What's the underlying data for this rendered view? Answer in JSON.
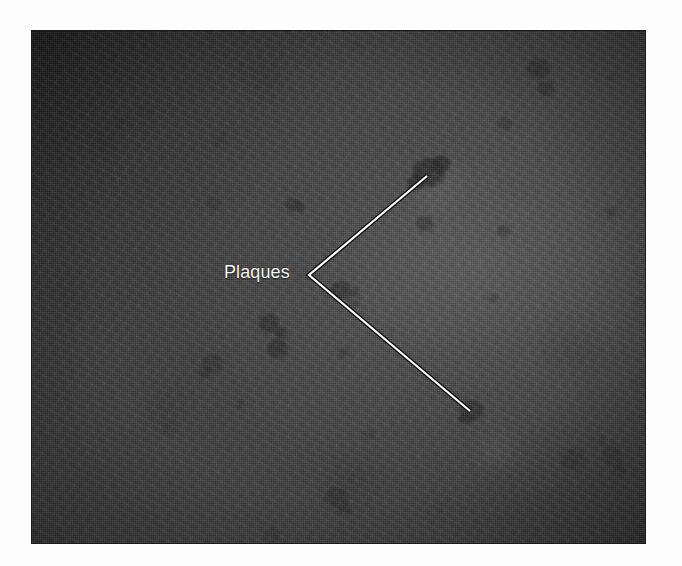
{
  "figure": {
    "kind": "micrograph",
    "alt_description": "Grayscale plaque assay micrograph showing dark circular plaques on a gray cell monolayer",
    "canvas": {
      "width": 682,
      "height": 566
    },
    "page_background": "#fdfdfd"
  },
  "micrograph": {
    "frame": {
      "x": 31,
      "y": 30,
      "width": 615,
      "height": 514
    },
    "base_color": "#3c3c3c",
    "border_color": "#1a1a1a",
    "illumination": {
      "bright_center": "#6e6e6e",
      "dark_corner": "#242424"
    }
  },
  "annotation": {
    "label": {
      "text": "Plaques",
      "color": "#f4f4f4",
      "x": 224,
      "y": 263,
      "font_size_px": 18
    },
    "leader": {
      "color": "#ffffff",
      "outline_color": "#111111",
      "stroke_width": 2.2,
      "vertex": {
        "x": 309,
        "y": 275
      },
      "tips": [
        {
          "x": 427,
          "y": 176,
          "target": "upper-plaque-cluster"
        },
        {
          "x": 470,
          "y": 411,
          "target": "lower-plaque"
        }
      ]
    }
  },
  "plaques": [
    {
      "cx": 131,
      "cy": 115,
      "rx": 13,
      "ry": 11,
      "shade": "#2a2a2a",
      "opacity": 0.74
    },
    {
      "cx": 120,
      "cy": 122,
      "rx": 8,
      "ry": 7,
      "shade": "#242424",
      "opacity": 0.7
    },
    {
      "cx": 145,
      "cy": 110,
      "rx": 7,
      "ry": 6,
      "shade": "#262626",
      "opacity": 0.6
    },
    {
      "cx": 218,
      "cy": 139,
      "rx": 8,
      "ry": 7,
      "shade": "#2c2c2c",
      "opacity": 0.62
    },
    {
      "cx": 50,
      "cy": 178,
      "rx": 10,
      "ry": 8,
      "shade": "#2a2a2a",
      "opacity": 0.66
    },
    {
      "cx": 213,
      "cy": 203,
      "rx": 7,
      "ry": 7,
      "shade": "#2c2c2c",
      "opacity": 0.58
    },
    {
      "cx": 292,
      "cy": 204,
      "rx": 8,
      "ry": 7,
      "shade": "#2a2a2a",
      "opacity": 0.62
    },
    {
      "cx": 299,
      "cy": 206,
      "rx": 5,
      "ry": 5,
      "shade": "#232323",
      "opacity": 0.6
    },
    {
      "cx": 538,
      "cy": 68,
      "rx": 12,
      "ry": 10,
      "shade": "#282828",
      "opacity": 0.72
    },
    {
      "cx": 545,
      "cy": 88,
      "rx": 9,
      "ry": 8,
      "shade": "#2a2a2a",
      "opacity": 0.66
    },
    {
      "cx": 504,
      "cy": 123,
      "rx": 8,
      "ry": 7,
      "shade": "#2e2e2e",
      "opacity": 0.58
    },
    {
      "cx": 612,
      "cy": 76,
      "rx": 5,
      "ry": 4,
      "shade": "#303030",
      "opacity": 0.48
    },
    {
      "cx": 428,
      "cy": 172,
      "rx": 17,
      "ry": 15,
      "shade": "#262626",
      "opacity": 0.78
    },
    {
      "cx": 440,
      "cy": 163,
      "rx": 10,
      "ry": 9,
      "shade": "#222222",
      "opacity": 0.7
    },
    {
      "cx": 415,
      "cy": 182,
      "rx": 9,
      "ry": 8,
      "shade": "#242424",
      "opacity": 0.7
    },
    {
      "cx": 503,
      "cy": 230,
      "rx": 7,
      "ry": 6,
      "shade": "#2f2f2f",
      "opacity": 0.52
    },
    {
      "cx": 610,
      "cy": 212,
      "rx": 7,
      "ry": 6,
      "shade": "#2e2e2e",
      "opacity": 0.52
    },
    {
      "cx": 424,
      "cy": 223,
      "rx": 9,
      "ry": 8,
      "shade": "#2d2d2d",
      "opacity": 0.56
    },
    {
      "cx": 340,
      "cy": 290,
      "rx": 11,
      "ry": 10,
      "shade": "#2a2a2a",
      "opacity": 0.68
    },
    {
      "cx": 268,
      "cy": 323,
      "rx": 11,
      "ry": 10,
      "shade": "#282828",
      "opacity": 0.7
    },
    {
      "cx": 280,
      "cy": 332,
      "rx": 7,
      "ry": 6,
      "shade": "#242424",
      "opacity": 0.64
    },
    {
      "cx": 277,
      "cy": 348,
      "rx": 11,
      "ry": 10,
      "shade": "#272727",
      "opacity": 0.7
    },
    {
      "cx": 212,
      "cy": 363,
      "rx": 11,
      "ry": 10,
      "shade": "#2b2b2b",
      "opacity": 0.66
    },
    {
      "cx": 204,
      "cy": 372,
      "rx": 7,
      "ry": 6,
      "shade": "#262626",
      "opacity": 0.62
    },
    {
      "cx": 168,
      "cy": 427,
      "rx": 8,
      "ry": 7,
      "shade": "#2d2d2d",
      "opacity": 0.58
    },
    {
      "cx": 239,
      "cy": 404,
      "rx": 6,
      "ry": 5,
      "shade": "#2e2e2e",
      "opacity": 0.52
    },
    {
      "cx": 353,
      "cy": 292,
      "rx": 6,
      "ry": 5,
      "shade": "#2d2d2d",
      "opacity": 0.5
    },
    {
      "cx": 343,
      "cy": 352,
      "rx": 7,
      "ry": 6,
      "shade": "#2f2f2f",
      "opacity": 0.5
    },
    {
      "cx": 471,
      "cy": 410,
      "rx": 12,
      "ry": 11,
      "shade": "#272727",
      "opacity": 0.74
    },
    {
      "cx": 464,
      "cy": 418,
      "rx": 7,
      "ry": 6,
      "shade": "#232323",
      "opacity": 0.66
    },
    {
      "cx": 368,
      "cy": 434,
      "rx": 7,
      "ry": 6,
      "shade": "#303030",
      "opacity": 0.46
    },
    {
      "cx": 572,
      "cy": 458,
      "rx": 12,
      "ry": 11,
      "shade": "#2b2b2b",
      "opacity": 0.68
    },
    {
      "cx": 611,
      "cy": 455,
      "rx": 11,
      "ry": 10,
      "shade": "#2a2a2a",
      "opacity": 0.66
    },
    {
      "cx": 618,
      "cy": 468,
      "rx": 7,
      "ry": 6,
      "shade": "#262626",
      "opacity": 0.62
    },
    {
      "cx": 599,
      "cy": 440,
      "rx": 6,
      "ry": 5,
      "shade": "#2e2e2e",
      "opacity": 0.5
    },
    {
      "cx": 335,
      "cy": 497,
      "rx": 12,
      "ry": 11,
      "shade": "#292929",
      "opacity": 0.7
    },
    {
      "cx": 344,
      "cy": 508,
      "rx": 7,
      "ry": 6,
      "shade": "#252525",
      "opacity": 0.62
    },
    {
      "cx": 272,
      "cy": 534,
      "rx": 9,
      "ry": 7,
      "shade": "#2c2c2c",
      "opacity": 0.56
    },
    {
      "cx": 339,
      "cy": 531,
      "rx": 6,
      "ry": 5,
      "shade": "#303030",
      "opacity": 0.44
    },
    {
      "cx": 437,
      "cy": 507,
      "rx": 6,
      "ry": 5,
      "shade": "#303030",
      "opacity": 0.44
    },
    {
      "cx": 492,
      "cy": 297,
      "rx": 6,
      "ry": 5,
      "shade": "#313131",
      "opacity": 0.42
    },
    {
      "cx": 353,
      "cy": 303,
      "rx": 5,
      "ry": 5,
      "shade": "#2f2f2f",
      "opacity": 0.44
    },
    {
      "cx": 93,
      "cy": 329,
      "rx": 5,
      "ry": 4,
      "shade": "#313131",
      "opacity": 0.4
    },
    {
      "cx": 640,
      "cy": 300,
      "rx": 6,
      "ry": 5,
      "shade": "#2f2f2f",
      "opacity": 0.44
    },
    {
      "cx": 637,
      "cy": 381,
      "rx": 6,
      "ry": 5,
      "shade": "#2f2f2f",
      "opacity": 0.42
    },
    {
      "cx": 46,
      "cy": 291,
      "rx": 5,
      "ry": 4,
      "shade": "#313131",
      "opacity": 0.38
    },
    {
      "cx": 49,
      "cy": 372,
      "rx": 5,
      "ry": 4,
      "shade": "#323232",
      "opacity": 0.36
    },
    {
      "cx": 178,
      "cy": 54,
      "rx": 6,
      "ry": 5,
      "shade": "#2e2e2e",
      "opacity": 0.46
    },
    {
      "cx": 356,
      "cy": 45,
      "rx": 6,
      "ry": 5,
      "shade": "#2e2e2e",
      "opacity": 0.46
    }
  ]
}
